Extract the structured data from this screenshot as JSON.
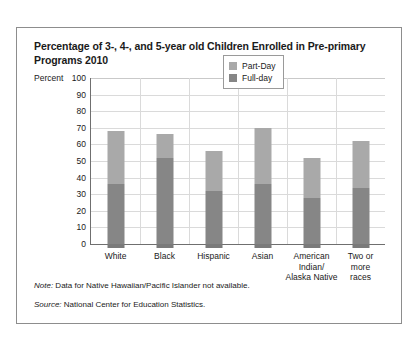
{
  "chart_data": {
    "type": "bar",
    "subtype": "stacked-vertical",
    "title": "Percentage of 3-, 4-, and 5-year old Children Enrolled in Pre-primary Programs 2010",
    "xlabel": "",
    "ylabel": "Percent",
    "ylim": [
      0,
      100
    ],
    "ytick_step": 10,
    "yticks": [
      "100",
      "90",
      "80",
      "70",
      "60",
      "50",
      "40",
      "30",
      "20",
      "10",
      "0"
    ],
    "grid": true,
    "legend_position": "top-right-inside",
    "categories": [
      "White",
      "Black",
      "Hispanic",
      "Asian",
      "American Indian/ Alaska Native",
      "Two or more races"
    ],
    "category_lines": [
      [
        "White"
      ],
      [
        "Black"
      ],
      [
        "Hispanic"
      ],
      [
        "Asian"
      ],
      [
        "American",
        "Indian/",
        "Alaska Native"
      ],
      [
        "Two or",
        "more",
        "races"
      ]
    ],
    "series": [
      {
        "name": "Full-day",
        "color": "#868686",
        "values": [
          36,
          52,
          32,
          36,
          28,
          34
        ]
      },
      {
        "name": "Part-Day",
        "color": "#a9a9a9",
        "values": [
          32,
          14,
          24,
          34,
          24,
          28
        ]
      }
    ],
    "totals": [
      68,
      66,
      56,
      70,
      52,
      62
    ],
    "note": "Data for Native Hawaiian/Pacific Islander not available.",
    "source": "National Center for Education Statistics."
  },
  "labels": {
    "note_prefix": "Note:",
    "source_prefix": "Source:"
  }
}
